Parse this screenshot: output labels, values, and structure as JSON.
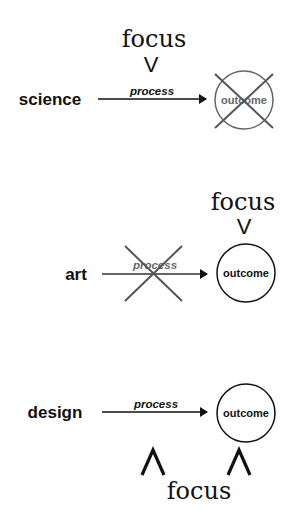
{
  "diagram": {
    "title": "",
    "colors": {
      "ink": "#111111",
      "struck": "#555555",
      "background": "#ffffff"
    },
    "rows": [
      {
        "discipline": "science",
        "process_label": "process",
        "outcome_label": "outcome",
        "focus_label": "focus",
        "focus_marker": "V",
        "focus_on": "process",
        "struck_out": "outcome"
      },
      {
        "discipline": "art",
        "process_label": "process",
        "outcome_label": "outcome",
        "focus_label": "focus",
        "focus_marker": "V",
        "focus_on": "outcome",
        "struck_out": "process"
      },
      {
        "discipline": "design",
        "process_label": "process",
        "outcome_label": "outcome",
        "focus_label": "focus",
        "focus_marker_process": "Λ",
        "focus_marker_outcome": "Λ",
        "focus_on": "process and outcome",
        "struck_out": "none"
      }
    ]
  }
}
